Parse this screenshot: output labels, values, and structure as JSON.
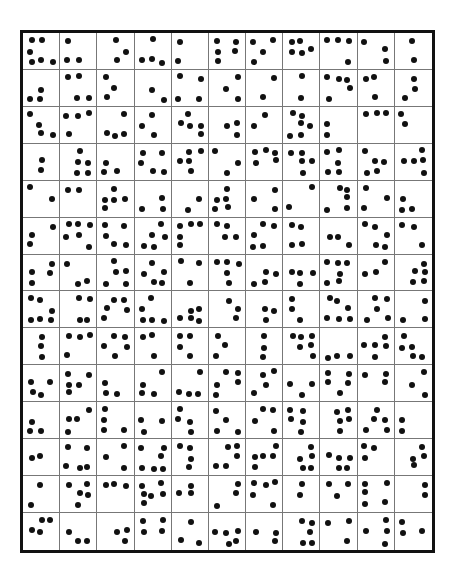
{
  "worksheet": {
    "rows": 14,
    "columns": 11,
    "dot_color": "#111111",
    "border_color": "#111111",
    "grid_line_color": "#777777",
    "cells": [
      [
        6,
        3,
        3,
        4,
        2,
        5,
        4,
        5,
        4,
        3,
        2
      ],
      [
        3,
        4,
        3,
        2,
        4,
        3,
        2,
        2,
        5,
        3,
        3
      ],
      [
        4,
        4,
        4,
        3,
        5,
        3,
        2,
        6,
        2,
        3,
        2
      ],
      [
        2,
        5,
        3,
        5,
        5,
        3,
        5,
        5,
        5,
        5,
        5
      ],
      [
        2,
        2,
        5,
        3,
        2,
        5,
        3,
        2,
        5,
        3,
        3
      ],
      [
        3,
        6,
        5,
        5,
        5,
        4,
        5,
        4,
        3,
        5,
        3
      ],
      [
        4,
        3,
        5,
        5,
        3,
        5,
        4,
        4,
        6,
        3,
        5
      ],
      [
        6,
        4,
        5,
        5,
        5,
        3,
        3,
        3,
        6,
        5,
        3
      ],
      [
        3,
        4,
        5,
        3,
        4,
        3,
        3,
        6,
        3,
        5,
        5
      ],
      [
        4,
        5,
        3,
        4,
        4,
        5,
        4,
        3,
        5,
        3,
        3
      ],
      [
        3,
        4,
        4,
        3,
        4,
        4,
        4,
        5,
        5,
        5,
        2
      ],
      [
        2,
        5,
        3,
        6,
        4,
        5,
        5,
        5,
        5,
        3,
        4
      ],
      [
        2,
        5,
        3,
        6,
        3,
        3,
        5,
        2,
        3,
        5,
        2
      ],
      [
        4,
        3,
        3,
        4,
        3,
        5,
        3,
        5,
        3,
        4,
        3
      ]
    ]
  }
}
